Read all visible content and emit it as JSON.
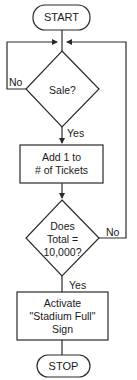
{
  "flowchart": {
    "start_label": "START",
    "stop_label": "STOP",
    "decision1": {
      "text": "Sale?",
      "no_label": "No",
      "yes_label": "Yes"
    },
    "process1": {
      "line1": "Add 1 to",
      "line2": "# of Tickets"
    },
    "decision2": {
      "line1": "Does",
      "line2": "Total =",
      "line3": "10,000?",
      "no_label": "No",
      "yes_label": "Yes"
    },
    "process2": {
      "line1": "Activate",
      "line2": "\"Stadium Full\"",
      "line3": "Sign"
    }
  },
  "colors": {
    "stroke": "#2a2a2a",
    "background": "#ffffff",
    "text": "#1a1a1a"
  }
}
